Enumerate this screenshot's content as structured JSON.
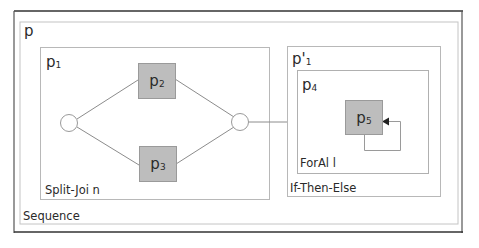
{
  "diagram": {
    "outer": {
      "label": "p",
      "caption": "Sequence"
    },
    "split_join": {
      "label": "p",
      "label_sub": "1",
      "caption": "Split-Joi n",
      "nodes": [
        {
          "label": "p",
          "sub": "2"
        },
        {
          "label": "p",
          "sub": "3"
        }
      ]
    },
    "if_then_else": {
      "label": "p'",
      "label_sub": "1",
      "caption": "If-Then-Else"
    },
    "forall": {
      "label": "p",
      "label_sub": "4",
      "caption": "ForAl l",
      "node": {
        "label": "p",
        "sub": "5"
      }
    },
    "colors": {
      "node_fill": "#bdbdbd",
      "box_stroke": "#b8b8b8",
      "frame_stroke": "#333333",
      "edge_stroke": "#8c8c8c"
    }
  }
}
